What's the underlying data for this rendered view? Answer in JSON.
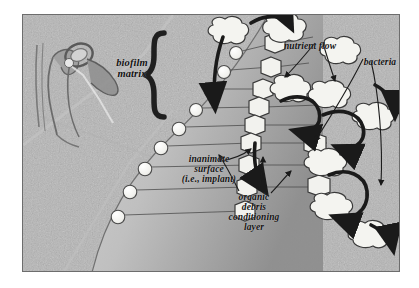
{
  "figure": {
    "frame_border_color": "#6d6d6d",
    "background_color": "#b4b4b4",
    "page_background": "#ffffff"
  },
  "labels": {
    "biofilm_matrix": "biofilm\nmatrix",
    "nutrient_flow": "nutrient flow",
    "bacteria": "bacteria",
    "inanimate_surface": "inanimate\nsurface\n(i.e., implant)",
    "organic_debris": "organic\ndebris\nconditioning\nlayer"
  },
  "colors": {
    "label_text": "#111111",
    "arrow": "#1a1a1a",
    "brace": "#1f1f1f",
    "bacteria_fill": "#f2f2ee",
    "bacteria_stroke": "#3a3a3a",
    "implant_light": "#c9c9c9",
    "implant_dark": "#9a9a9a",
    "debris_circle": "#f4f4f0",
    "leader_line": "#444444"
  },
  "elements": {
    "anatomy_drawing": "joint-implant-anatomical-sketch",
    "brace": "curly-brace-open",
    "implant_surface": "implant-arc",
    "debris_circles_count": 9,
    "hexagon_bacteria_count": 11,
    "blob_bacteria_count": 9,
    "flow_arrows_count": 8
  }
}
